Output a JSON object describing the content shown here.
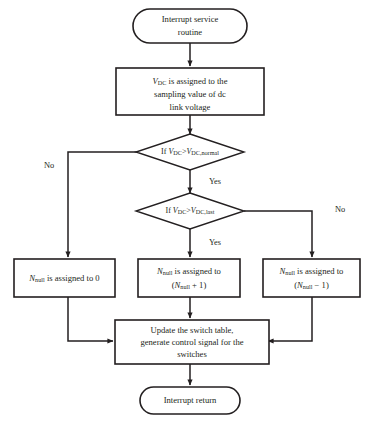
{
  "diagram": {
    "colors": {
      "stroke": "#231f20",
      "fill": "#ffffff",
      "background": "#ffffff"
    },
    "nodes": {
      "start": {
        "type": "terminal",
        "line1": "Interrupt service",
        "line2": "routine"
      },
      "sample": {
        "type": "process",
        "line1_var": "V",
        "line1_sub": "DC",
        "line1_rest": " is assigned to the",
        "line2": "sampling value of dc",
        "line3": "link voltage"
      },
      "decision_normal": {
        "type": "decision",
        "prefix": "If ",
        "lhs_var": "V",
        "lhs_sub": "DC",
        "operator": ">",
        "rhs_var": "V",
        "rhs_sub": "DC,normal"
      },
      "decision_last": {
        "type": "decision",
        "prefix": "If ",
        "lhs_var": "V",
        "lhs_sub": "DC",
        "operator": ">",
        "rhs_var": "V",
        "rhs_sub": "DC,last"
      },
      "assign_zero": {
        "type": "process",
        "var": "N",
        "sub": "null",
        "rest": " is assigned to 0"
      },
      "assign_inc": {
        "type": "process",
        "line1_var": "N",
        "line1_sub": "null",
        "line1_rest": " is assigned to",
        "line2_open": "(",
        "line2_var": "N",
        "line2_sub": "null",
        "line2_rest": " + 1)"
      },
      "assign_dec": {
        "type": "process",
        "line1_var": "N",
        "line1_sub": "null",
        "line1_rest": " is assigned to",
        "line2_open": "(",
        "line2_var": "N",
        "line2_sub": "null",
        "line2_rest": " − 1)"
      },
      "update": {
        "type": "process",
        "line1": "Update the switch table,",
        "line2": "generate control signal for the",
        "line3": "switches"
      },
      "end": {
        "type": "terminal",
        "line1": "Interrupt return"
      }
    },
    "edge_labels": {
      "no_left": "No",
      "yes_first": "Yes",
      "yes_second": "Yes",
      "no_right": "No"
    }
  }
}
